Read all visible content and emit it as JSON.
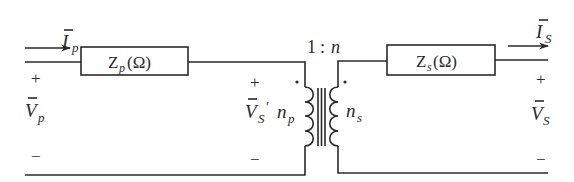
{
  "diagram": {
    "type": "transformer equivalent circuit",
    "colors": {
      "line": "#2a2a2a",
      "background": "#ffffff"
    },
    "primary": {
      "current_label": {
        "symbol": "I",
        "subscript": "p",
        "overbar": true
      },
      "voltage_label": {
        "symbol": "V",
        "subscript": "p",
        "overbar": true
      },
      "plus": "+",
      "minus": "−",
      "impedance": {
        "symbol": "Z",
        "subscript": "p",
        "unit": "(Ω)"
      }
    },
    "transformer": {
      "ratio": {
        "left": "1",
        "sep": ":",
        "right": "n"
      },
      "primary_turns": {
        "symbol": "n",
        "subscript": "p"
      },
      "secondary_turns": {
        "symbol": "n",
        "subscript": "s"
      },
      "referred_voltage": {
        "symbol": "V",
        "subscript": "S",
        "prime": "′",
        "overbar": true
      },
      "plus": "+",
      "minus": "−"
    },
    "secondary": {
      "current_label": {
        "symbol": "I",
        "subscript": "S",
        "overbar": true
      },
      "voltage_label": {
        "symbol": "V",
        "subscript": "S",
        "overbar": true
      },
      "plus": "+",
      "minus": "−",
      "impedance": {
        "symbol": "Z",
        "subscript": "s",
        "unit": "(Ω)"
      }
    }
  }
}
